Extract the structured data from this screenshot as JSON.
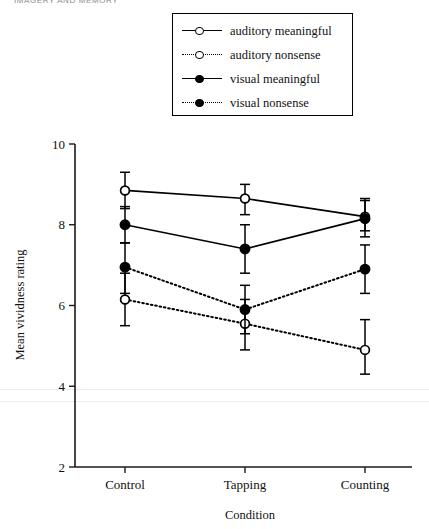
{
  "running_head": "IMAGERY AND MEMORY",
  "chart_data": {
    "type": "line",
    "title": "",
    "xlabel": "Condition",
    "ylabel": "Mean vividness rating",
    "categories": [
      "Control",
      "Tapping",
      "Counting"
    ],
    "ylim": [
      2,
      10
    ],
    "yticks": [
      2,
      4,
      6,
      8,
      10
    ],
    "ytick_labels": [
      "2",
      "4",
      "6",
      "8",
      "10"
    ],
    "grid": false,
    "legend_position": "top-right",
    "error_bars": "visible",
    "series": [
      {
        "name": "auditory meaningful",
        "marker": "open-circle",
        "line_style": "solid",
        "values": [
          8.85,
          8.65,
          8.2
        ],
        "err_low": [
          8.4,
          8.25,
          7.85
        ],
        "err_high": [
          9.3,
          9.0,
          8.6
        ]
      },
      {
        "name": "auditory nonsense",
        "marker": "open-circle",
        "line_style": "dotted",
        "values": [
          6.15,
          5.55,
          4.9
        ],
        "err_low": [
          5.5,
          4.9,
          4.3
        ],
        "err_high": [
          6.8,
          6.15,
          5.65
        ]
      },
      {
        "name": "visual meaningful",
        "marker": "filled-circle",
        "line_style": "solid",
        "values": [
          8.0,
          7.4,
          8.15
        ],
        "err_low": [
          7.55,
          6.8,
          7.7
        ],
        "err_high": [
          8.45,
          8.0,
          8.65
        ]
      },
      {
        "name": "visual nonsense",
        "marker": "filled-circle",
        "line_style": "dotted",
        "values": [
          6.95,
          5.9,
          6.9
        ],
        "err_low": [
          6.3,
          5.3,
          6.3
        ],
        "err_high": [
          7.55,
          6.5,
          7.5
        ]
      }
    ]
  },
  "legend": {
    "items": [
      {
        "label": "auditory meaningful",
        "marker": "open-circle",
        "line_style": "solid"
      },
      {
        "label": "auditory nonsense",
        "marker": "open-circle",
        "line_style": "dotted"
      },
      {
        "label": "visual meaningful",
        "marker": "filled-circle",
        "line_style": "solid"
      },
      {
        "label": "visual nonsense",
        "marker": "filled-circle",
        "line_style": "dotted"
      }
    ]
  }
}
